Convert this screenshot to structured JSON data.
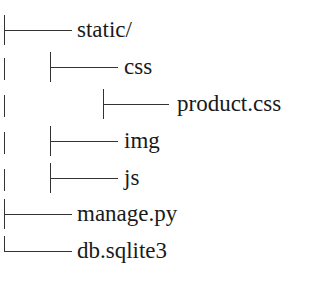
{
  "tree": {
    "rows": [
      {
        "label": "static/",
        "depth": 0,
        "connector": "tee"
      },
      {
        "label": "css",
        "depth": 1,
        "connector": "tee"
      },
      {
        "label": "product.css",
        "depth": 2,
        "connector": "tee"
      },
      {
        "label": "img",
        "depth": 1,
        "connector": "tee"
      },
      {
        "label": "js",
        "depth": 1,
        "connector": "tee"
      },
      {
        "label": "manage.py",
        "depth": 0,
        "connector": "tee"
      },
      {
        "label": "db.sqlite3",
        "depth": 0,
        "connector": "corner"
      }
    ]
  }
}
